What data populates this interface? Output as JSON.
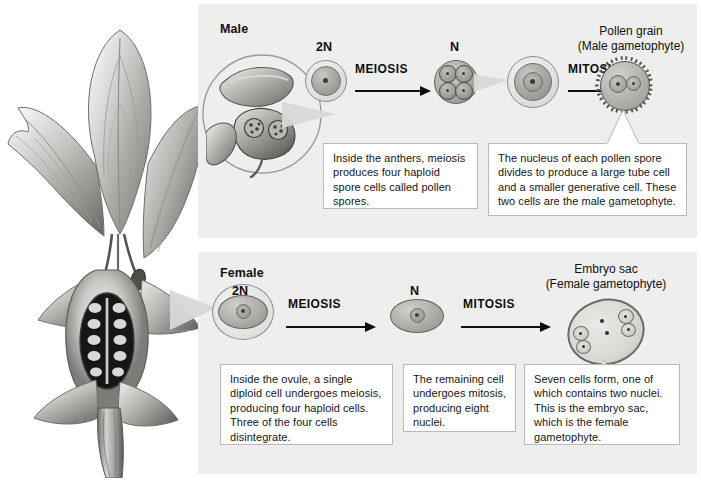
{
  "figure": {
    "illustration_name": "flowering-plant-cutaway"
  },
  "male": {
    "panel_label": "Male",
    "source_label": "anther-magnification",
    "ploidy_start": "2N",
    "ploidy_mid": "N",
    "process_1": "MEIOSIS",
    "process_2": "MITOSIS",
    "product_title": "Pollen grain",
    "product_subtitle": "(Male gametophyte)",
    "callout_1": "Inside the anthers, meiosis produces four haploid spore cells called pollen spores.",
    "callout_2": "The nucleus of each pollen spore divides to produce a large tube cell and a smaller generative cell. These two cells are the male gametophyte."
  },
  "female": {
    "panel_label": "Female",
    "source_label": "ovule-magnification",
    "ploidy_start": "2N",
    "ploidy_mid": "N",
    "process_1": "MEIOSIS",
    "process_2": "MITOSIS",
    "product_title": "Embryo sac",
    "product_subtitle": "(Female gametophyte)",
    "callout_1": "Inside the ovule, a single diploid cell undergoes meiosis, producing four haploid cells. Three of the four cells disintegrate.",
    "callout_2": "The remaining cell undergoes mitosis, producing eight nuclei.",
    "callout_3": "Seven cells form, one of which contains two nuclei. This is the embryo sac, which is the female gametophyte."
  },
  "colors": {
    "panel_background": "#eeeeee",
    "page_background": "#ffffff",
    "callout_background": "#ffffff",
    "callout_border": "#b9b9b9",
    "text": "#111111",
    "arrow": "#0d0d0d",
    "cell_outline": "#6a6a66"
  }
}
